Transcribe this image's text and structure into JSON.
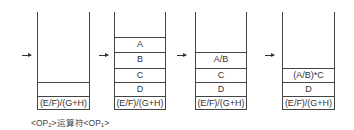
{
  "diagram": {
    "type": "stack-evolution",
    "stacks": [
      {
        "id": 1,
        "cells": [
          "",
          "(E/F)/(G+H)"
        ]
      },
      {
        "id": 2,
        "cells": [
          "A",
          "B",
          "C",
          "D",
          "(E/F)/(G+H)"
        ]
      },
      {
        "id": 3,
        "cells": [
          "A/B",
          "C",
          "D",
          "(E/F)/(G+H)"
        ]
      },
      {
        "id": 4,
        "cells": [
          "(A/B)*C",
          "D",
          "(E/F)/(G+H)"
        ]
      }
    ],
    "caption": {
      "op2": "<OP",
      "op2_sub": "2",
      "middle": ">运算符<OP",
      "op1_sub": "1",
      "end": ">"
    },
    "colors": {
      "line": "#444444",
      "text": "#333333",
      "background": "#ffffff"
    }
  }
}
